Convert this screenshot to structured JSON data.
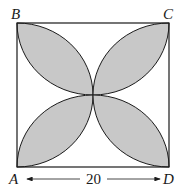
{
  "diagram": {
    "type": "geometry",
    "vertices": {
      "A": "A",
      "B": "B",
      "C": "C",
      "D": "D"
    },
    "side_label": "20",
    "colors": {
      "shade": "#c8c8c8",
      "stroke": "#1a1a1a",
      "background": "#ffffff"
    }
  }
}
